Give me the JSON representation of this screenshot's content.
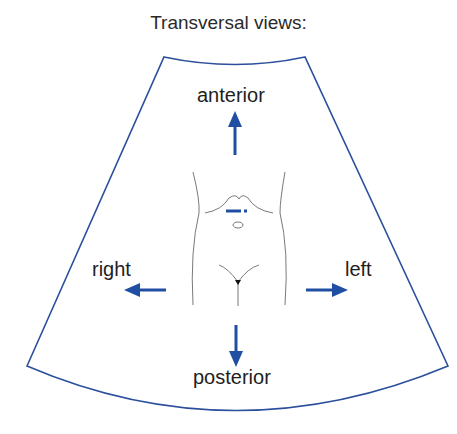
{
  "title": "Transversal views:",
  "labels": {
    "anterior": "anterior",
    "posterior": "posterior",
    "right": "right",
    "left": "left"
  },
  "colors": {
    "accent": "#1f4ea3",
    "outline": "#2b4f9c",
    "body_line": "#6a6a6a",
    "text": "#1e1e1e"
  },
  "icons": {
    "arrow_up": "anterior-arrow",
    "arrow_down": "posterior-arrow",
    "arrow_left": "right-arrow",
    "arrow_right": "left-arrow",
    "probe": "transducer-marker"
  }
}
